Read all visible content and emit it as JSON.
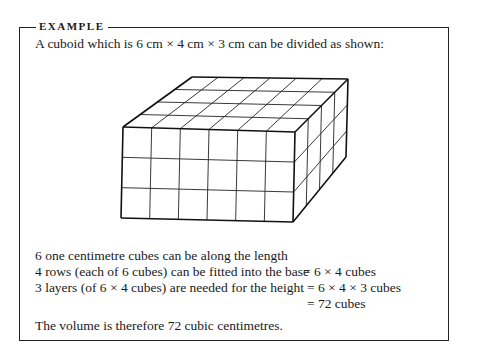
{
  "example": {
    "heading": "EXAMPLE",
    "intro": "A cuboid which is 6 cm × 4 cm × 3 cm can be divided as shown:",
    "figure": {
      "name": "cuboid-6x4x3",
      "length_cubes": 6,
      "width_cubes": 4,
      "height_cubes": 3
    },
    "lines": [
      "6 one centimetre cubes can be along the length",
      "4 rows (each of 6 cubes) can be fitted into the base",
      "3 layers (of 6 × 4 cubes) are needed for the height"
    ],
    "equations": [
      "= 6 × 4 cubes",
      "= 6 × 4 × 3 cubes",
      "= 72 cubes"
    ],
    "conclusion": "The volume is therefore 72 cubic centimetres."
  }
}
